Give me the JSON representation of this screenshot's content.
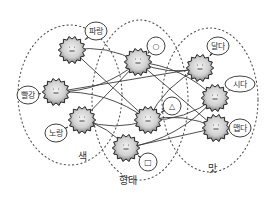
{
  "diagram": {
    "type": "network",
    "colors": {
      "line": "#3a3a3a",
      "dotted": "#555555",
      "node_fill_outer": "#8a8a8a",
      "node_fill_inner": "#e8e8e8",
      "bubble_fill": "#ffffff",
      "text": "#333333"
    },
    "groups": [
      {
        "id": "color",
        "label": "색",
        "cx": 70,
        "cy": 95,
        "rx": 52,
        "ry": 70,
        "label_x": 82,
        "label_y": 160
      },
      {
        "id": "shape",
        "label": "형태",
        "cx": 140,
        "cy": 100,
        "rx": 48,
        "ry": 80,
        "label_x": 128,
        "label_y": 184
      },
      {
        "id": "taste",
        "label": "맛",
        "cx": 210,
        "cy": 100,
        "rx": 48,
        "ry": 72,
        "label_x": 212,
        "label_y": 172
      }
    ],
    "nodes": [
      {
        "id": "blue",
        "group": "color",
        "label": "파랑",
        "x": 72,
        "y": 50,
        "bx": 96,
        "by": 31,
        "bw": 22,
        "bh": 18
      },
      {
        "id": "red",
        "group": "color",
        "label": "빨강",
        "x": 56,
        "y": 92,
        "bx": 28,
        "by": 95,
        "bw": 22,
        "bh": 18
      },
      {
        "id": "yellow",
        "group": "color",
        "label": "노랑",
        "x": 82,
        "y": 120,
        "bx": 56,
        "by": 133,
        "bw": 22,
        "bh": 18
      },
      {
        "id": "circle",
        "group": "shape",
        "label": "○",
        "x": 138,
        "y": 62,
        "bx": 156,
        "by": 46,
        "bw": 18,
        "bh": 18
      },
      {
        "id": "triangle",
        "group": "shape",
        "label": "△",
        "x": 148,
        "y": 120,
        "bx": 172,
        "by": 106,
        "bw": 18,
        "bh": 18
      },
      {
        "id": "square",
        "group": "shape",
        "label": "□",
        "x": 126,
        "y": 148,
        "bx": 148,
        "by": 162,
        "bw": 18,
        "bh": 18
      },
      {
        "id": "sweet",
        "group": "taste",
        "label": "달다",
        "x": 200,
        "y": 68,
        "bx": 218,
        "by": 46,
        "bw": 22,
        "bh": 18
      },
      {
        "id": "sour",
        "group": "taste",
        "label": "시다",
        "x": 215,
        "y": 98,
        "bx": 240,
        "by": 84,
        "bw": 30,
        "bh": 16
      },
      {
        "id": "spicy",
        "group": "taste",
        "label": "맵다",
        "x": 216,
        "y": 128,
        "bx": 240,
        "by": 128,
        "bw": 22,
        "bh": 18
      }
    ],
    "edges": [
      [
        "blue",
        "circle"
      ],
      [
        "blue",
        "triangle"
      ],
      [
        "red",
        "circle"
      ],
      [
        "red",
        "triangle"
      ],
      [
        "red",
        "sweet"
      ],
      [
        "yellow",
        "triangle"
      ],
      [
        "yellow",
        "square"
      ],
      [
        "yellow",
        "circle"
      ],
      [
        "circle",
        "sweet"
      ],
      [
        "circle",
        "sour"
      ],
      [
        "circle",
        "spicy"
      ],
      [
        "triangle",
        "sour"
      ],
      [
        "triangle",
        "sweet"
      ],
      [
        "square",
        "spicy"
      ],
      [
        "square",
        "sour"
      ],
      [
        "triangle",
        "spicy"
      ]
    ]
  }
}
